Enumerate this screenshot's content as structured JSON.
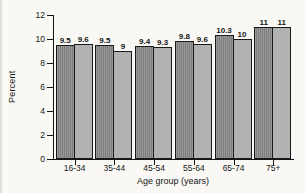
{
  "page": {
    "background": "#f9f8f4"
  },
  "chart_data": {
    "type": "bar",
    "title": "",
    "categories": [
      "16-34",
      "35-44",
      "45-54",
      "55-64",
      "65-74",
      "75+"
    ],
    "series": [
      {
        "name": "series-1",
        "values": [
          9.5,
          9.5,
          9.4,
          9.8,
          10.3,
          11
        ]
      },
      {
        "name": "series-2",
        "values": [
          9.6,
          9,
          9.3,
          9.6,
          10,
          11
        ]
      }
    ],
    "xlabel": "Age group (years)",
    "ylabel": "Percent",
    "ylim": [
      0,
      12
    ],
    "yticks": [
      0,
      2,
      4,
      6,
      8,
      10,
      12
    ],
    "grid": false,
    "legend": "none",
    "value_labels": true,
    "colors": {
      "series1_fill": "#7d7d7d",
      "series1_stripe": "#989898",
      "series2_fill": "#b2b2b2",
      "bar_border": "#1a1a1a",
      "axis": "#141414",
      "text": "#161616"
    }
  }
}
